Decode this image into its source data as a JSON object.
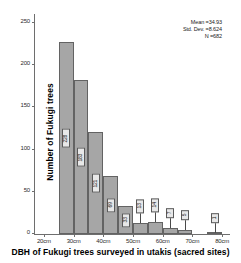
{
  "chart_data": {
    "type": "bar",
    "title": "",
    "xlabel": "DBH of Fukugi trees surveyed in utakis (sacred sites)",
    "ylabel": "Number of Fukugi trees",
    "bin_width_cm": 5,
    "categories": [
      "25-30",
      "30-35",
      "35-40",
      "40-45",
      "45-50",
      "50-55",
      "55-60",
      "60-65",
      "65-70",
      "75-80"
    ],
    "bin_starts": [
      25,
      30,
      35,
      40,
      45,
      50,
      55,
      60,
      65,
      75
    ],
    "values": [
      228,
      183,
      121,
      69,
      33,
      13,
      14,
      7,
      5,
      1
    ],
    "bar_labels": [
      "228",
      "183",
      "121",
      "69",
      "33",
      "13",
      "14",
      "7",
      "5",
      "1"
    ],
    "xlim": [
      17,
      83
    ],
    "ylim": [
      0,
      262
    ],
    "xticks": [
      20,
      30,
      40,
      50,
      60,
      70,
      80
    ],
    "xtick_labels": [
      "20cm",
      "30cm",
      "40cm",
      "50cm",
      "60cm",
      "70cm",
      "80cm"
    ],
    "yticks": [
      0,
      50,
      100,
      150,
      200,
      250
    ],
    "ytick_labels": [
      "0",
      "50",
      "100",
      "150",
      "200",
      "250"
    ],
    "grid": false,
    "legend": false,
    "bar_color": "#a6a6a6",
    "bar_edge_color": "#636363",
    "axis_color": "#6e6e6e"
  },
  "stats": {
    "mean_label": "Mean =34.93",
    "std_dev_label": "Std. Dev. =8.624",
    "n_label": "N =682"
  }
}
